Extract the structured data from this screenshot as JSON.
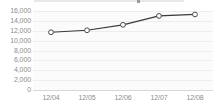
{
  "chart_data": {
    "type": "line",
    "title": "",
    "xlabel": "",
    "ylabel": "",
    "categories": [
      "12/04",
      "12/05",
      "12/06",
      "12/07",
      "12/08"
    ],
    "values": [
      11700,
      12100,
      13200,
      15000,
      15300
    ],
    "series": [
      {
        "name": "",
        "values": [
          11700,
          12100,
          13200,
          15000,
          15300
        ]
      }
    ],
    "ylim": [
      0,
      16000
    ],
    "ytick_step": 2000,
    "ytick_labels": [
      "16,000",
      "14,000",
      "12,000",
      "10,000",
      "8,000",
      "6,000",
      "4,000",
      "2,000",
      "0"
    ],
    "ytick_values": [
      16000,
      14000,
      12000,
      10000,
      8000,
      6000,
      4000,
      2000,
      0
    ],
    "grid": true,
    "legend": "none",
    "marker": "open-circle",
    "colors": {
      "line": "#3a3a3a",
      "marker_fill": "#ffffff",
      "marker_stroke": "#4a4a4a",
      "grid": "#ededed",
      "axis": "#d8d8d8",
      "tick_label": "#8c8c8c",
      "plot_background": "#fbfbfb",
      "page_background": "#ffffff"
    }
  }
}
